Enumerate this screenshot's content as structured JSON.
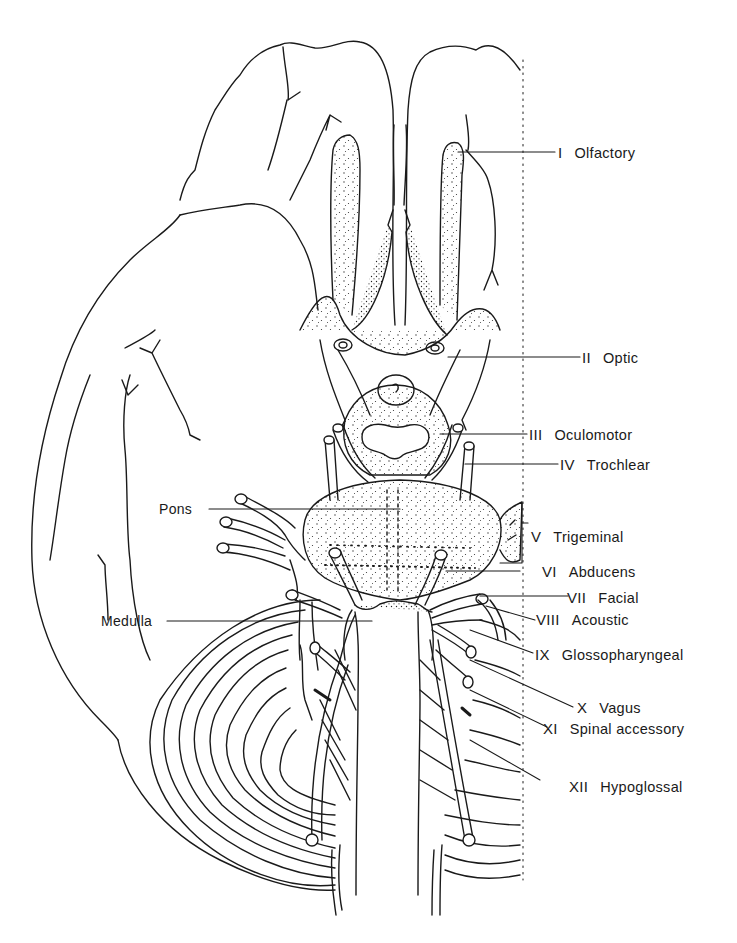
{
  "figure": {
    "type": "anatomical line drawing",
    "ink_color": "#1a1a1a",
    "background": "#ffffff"
  },
  "labels": {
    "cranial_nerves": [
      {
        "numeral": "I",
        "name": "Olfactory"
      },
      {
        "numeral": "II",
        "name": "Optic"
      },
      {
        "numeral": "III",
        "name": "Oculomotor"
      },
      {
        "numeral": "IV",
        "name": "Trochlear"
      },
      {
        "numeral": "V",
        "name": "Trigeminal"
      },
      {
        "numeral": "VI",
        "name": "Abducens"
      },
      {
        "numeral": "VII",
        "name": "Facial"
      },
      {
        "numeral": "VIII",
        "name": "Acoustic"
      },
      {
        "numeral": "IX",
        "name": "Glossopharyngeal"
      },
      {
        "numeral": "X",
        "name": "Vagus"
      },
      {
        "numeral": "XI",
        "name": "Spinal accessory"
      },
      {
        "numeral": "XII",
        "name": "Hypoglossal"
      }
    ],
    "structures": [
      {
        "name": "Pons"
      },
      {
        "name": "Medulla"
      }
    ]
  }
}
